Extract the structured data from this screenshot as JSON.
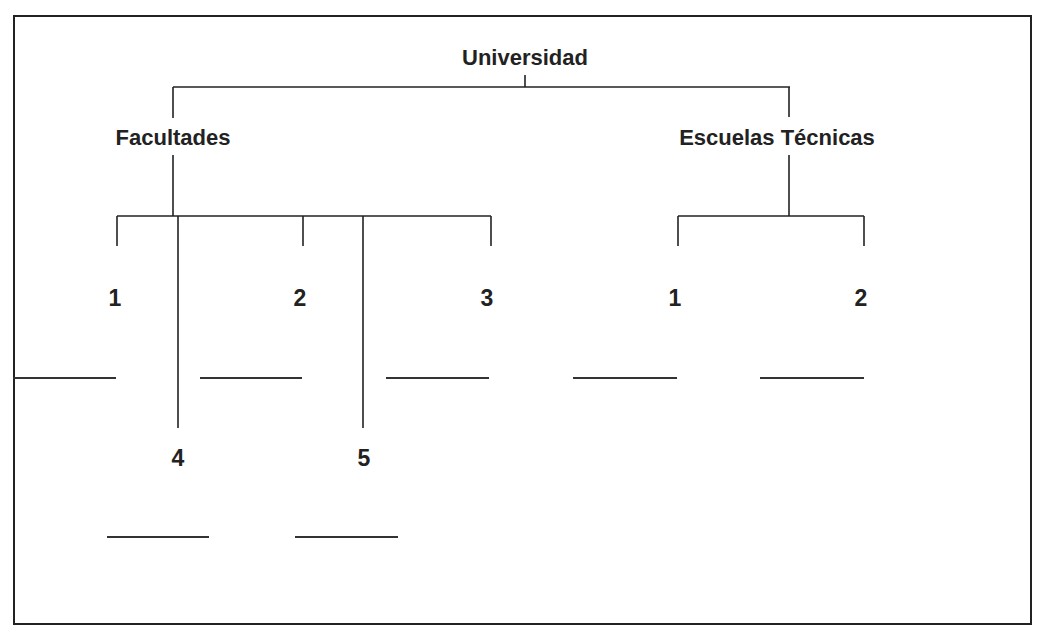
{
  "diagram": {
    "root": {
      "label": "Universidad"
    },
    "branches": [
      {
        "label": "Facultades",
        "children": [
          {
            "number": "1",
            "answer": ""
          },
          {
            "number": "2",
            "answer": ""
          },
          {
            "number": "3",
            "answer": ""
          },
          {
            "number": "4",
            "answer": ""
          },
          {
            "number": "5",
            "answer": ""
          }
        ]
      },
      {
        "label": "Escuelas Técnicas",
        "children": [
          {
            "number": "1",
            "answer": ""
          },
          {
            "number": "2",
            "answer": ""
          }
        ]
      }
    ],
    "line_color": "#222222"
  }
}
